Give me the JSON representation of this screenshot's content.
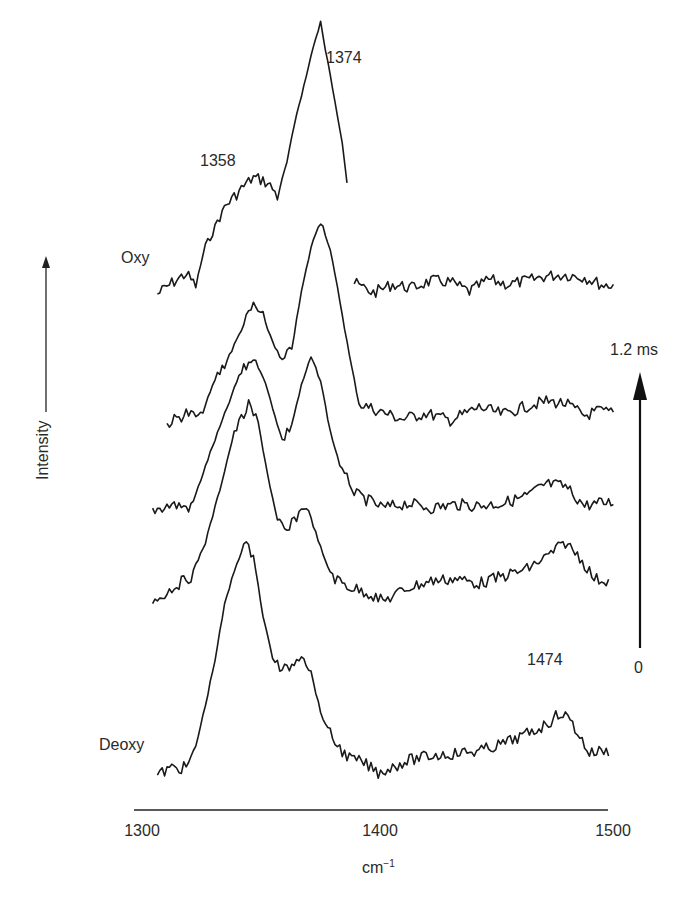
{
  "chart_data": {
    "type": "line",
    "title": "",
    "xlabel": "cm",
    "xlabel_superscript": "−1",
    "ylabel": "Intensity",
    "xlim": [
      1300,
      1500
    ],
    "x_ticks": [
      "1300",
      "1400",
      "1500"
    ],
    "grid": false,
    "stacked_offset": true,
    "time_axis": {
      "start_label": "0",
      "end_label": "1.2 ms",
      "direction": "up"
    },
    "trace_labels": {
      "top": "Oxy",
      "bottom": "Deoxy"
    },
    "annotations": [
      {
        "text": "1374",
        "x": 1374
      },
      {
        "text": "1358",
        "x": 1358
      },
      {
        "text": "1474",
        "x": 1474
      }
    ],
    "series": [
      {
        "name": "Oxy",
        "segments": [
          {
            "x": [
              1306,
              1312,
              1318,
              1322,
              1326,
              1330,
              1334,
              1338,
              1342,
              1346,
              1350,
              1354,
              1356,
              1360,
              1364,
              1368,
              1371,
              1374,
              1377,
              1380,
              1383,
              1385
            ],
            "y": [
              0.05,
              0.14,
              0.22,
              0.12,
              0.46,
              0.62,
              0.78,
              0.86,
              0.95,
              1.02,
              1.0,
              0.93,
              0.86,
              1.15,
              1.55,
              1.86,
              2.12,
              2.3,
              1.98,
              1.66,
              1.32,
              0.98
            ]
          },
          {
            "x": [
              1388,
              1396,
              1404,
              1412,
              1420,
              1428,
              1436,
              1444,
              1452,
              1460,
              1468,
              1476,
              1484,
              1492,
              1496
            ],
            "y": [
              0.14,
              0.06,
              0.13,
              0.1,
              0.16,
              0.15,
              0.07,
              0.17,
              0.13,
              0.16,
              0.2,
              0.21,
              0.19,
              0.12,
              0.13
            ]
          }
        ]
      },
      {
        "name": "t2",
        "x": [
          1310,
          1318,
          1324,
          1330,
          1336,
          1342,
          1346,
          1350,
          1354,
          1358,
          1362,
          1366,
          1370,
          1374,
          1378,
          1382,
          1386,
          1390,
          1398,
          1408,
          1418,
          1428,
          1440,
          1450,
          1460,
          1468,
          1476,
          1484,
          1490,
          1496
        ],
        "y": [
          0.05,
          0.14,
          0.1,
          0.42,
          0.62,
          0.88,
          1.04,
          0.94,
          0.74,
          0.56,
          0.68,
          1.15,
          1.52,
          1.76,
          1.5,
          1.08,
          0.62,
          0.22,
          0.16,
          0.09,
          0.14,
          0.08,
          0.19,
          0.13,
          0.2,
          0.24,
          0.22,
          0.12,
          0.16,
          0.14
        ]
      },
      {
        "name": "t3",
        "x": [
          1304,
          1312,
          1320,
          1328,
          1334,
          1340,
          1346,
          1350,
          1354,
          1358,
          1362,
          1366,
          1370,
          1374,
          1378,
          1382,
          1388,
          1394,
          1400,
          1410,
          1420,
          1430,
          1440,
          1450,
          1460,
          1468,
          1476,
          1484,
          1490,
          1496
        ],
        "y": [
          0.08,
          0.13,
          0.1,
          0.56,
          0.88,
          1.2,
          1.36,
          1.2,
          0.94,
          0.66,
          0.8,
          1.12,
          1.36,
          1.16,
          0.74,
          0.46,
          0.22,
          0.16,
          0.1,
          0.14,
          0.1,
          0.13,
          0.12,
          0.14,
          0.2,
          0.3,
          0.28,
          0.12,
          0.14,
          0.15
        ]
      },
      {
        "name": "t4",
        "x": [
          1304,
          1312,
          1320,
          1326,
          1332,
          1338,
          1344,
          1348,
          1352,
          1356,
          1360,
          1364,
          1368,
          1372,
          1376,
          1380,
          1386,
          1394,
          1400,
          1410,
          1420,
          1430,
          1440,
          1450,
          1460,
          1468,
          1476,
          1482,
          1488,
          1494
        ],
        "y": [
          0.02,
          0.14,
          0.24,
          0.52,
          0.96,
          1.44,
          1.66,
          1.52,
          1.08,
          0.7,
          0.6,
          0.74,
          0.84,
          0.6,
          0.36,
          0.22,
          0.15,
          0.1,
          0.03,
          0.14,
          0.2,
          0.22,
          0.18,
          0.24,
          0.3,
          0.4,
          0.52,
          0.4,
          0.22,
          0.2
        ]
      },
      {
        "name": "Deoxy",
        "x": [
          1306,
          1312,
          1318,
          1322,
          1326,
          1330,
          1334,
          1338,
          1342,
          1346,
          1350,
          1354,
          1358,
          1362,
          1366,
          1370,
          1374,
          1378,
          1382,
          1386,
          1392,
          1398,
          1402,
          1410,
          1420,
          1430,
          1440,
          1450,
          1460,
          1468,
          1474,
          1478,
          1482,
          1486,
          1490,
          1494
        ],
        "y": [
          0.0,
          0.06,
          0.06,
          0.24,
          0.58,
          0.96,
          1.42,
          1.7,
          1.92,
          1.84,
          1.32,
          0.98,
          0.86,
          0.92,
          1.02,
          0.86,
          0.52,
          0.34,
          0.22,
          0.14,
          0.1,
          0.02,
          0.05,
          0.12,
          0.16,
          0.18,
          0.2,
          0.26,
          0.34,
          0.42,
          0.52,
          0.46,
          0.32,
          0.18,
          0.2,
          0.2
        ]
      }
    ]
  },
  "labels": {
    "oxy": "Oxy",
    "deoxy": "Deoxy",
    "intensity": "Intensity",
    "peak_1374": "1374",
    "peak_1358": "1358",
    "peak_1474": "1474",
    "time_end": "1.2 ms",
    "time_start": "0",
    "tick_1300": "1300",
    "tick_1400": "1400",
    "tick_1500": "1500",
    "xunit": "cm",
    "xunit_sup": "−1"
  }
}
